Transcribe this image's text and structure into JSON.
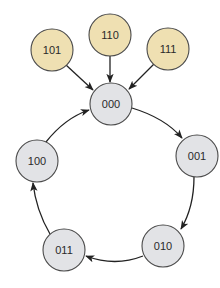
{
  "diagram": {
    "type": "state-transition-graph",
    "colors": {
      "transient_fill": "#efe0b2",
      "cycle_fill": "#e2e3e6",
      "stroke": "#4a4a4a",
      "edge": "#222222"
    },
    "nodes": [
      {
        "id": "101",
        "label": "101",
        "group": "transient",
        "x": 52,
        "y": 50
      },
      {
        "id": "110",
        "label": "110",
        "group": "transient",
        "x": 110,
        "y": 35
      },
      {
        "id": "111",
        "label": "111",
        "group": "transient",
        "x": 168,
        "y": 49
      },
      {
        "id": "000",
        "label": "000",
        "group": "cycle",
        "x": 111,
        "y": 104
      },
      {
        "id": "001",
        "label": "001",
        "group": "cycle",
        "x": 197,
        "y": 156
      },
      {
        "id": "010",
        "label": "010",
        "group": "cycle",
        "x": 163,
        "y": 246
      },
      {
        "id": "011",
        "label": "011",
        "group": "cycle",
        "x": 64,
        "y": 250
      },
      {
        "id": "100",
        "label": "100",
        "group": "cycle",
        "x": 37,
        "y": 161
      }
    ],
    "edges": [
      {
        "from": "101",
        "to": "000"
      },
      {
        "from": "110",
        "to": "000"
      },
      {
        "from": "111",
        "to": "000"
      },
      {
        "from": "000",
        "to": "001"
      },
      {
        "from": "001",
        "to": "010"
      },
      {
        "from": "010",
        "to": "011"
      },
      {
        "from": "011",
        "to": "100"
      },
      {
        "from": "100",
        "to": "000"
      }
    ]
  }
}
